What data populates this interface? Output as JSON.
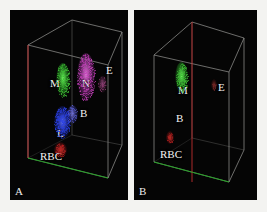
{
  "figure": {
    "background": "#f3f3f1",
    "panel_background": "#050505",
    "wire_color": "#9a9a96",
    "axis_colors": {
      "x": "#1faa1f",
      "y": "#c03030",
      "z": "#9a9a96"
    }
  },
  "panels": [
    {
      "id": "A",
      "label": "A",
      "labels": [
        {
          "text": "M",
          "x": 40,
          "y": 68,
          "color": "#f4f4f2"
        },
        {
          "text": "N",
          "x": 72,
          "y": 68,
          "color": "#f4f4f2"
        },
        {
          "text": "E",
          "x": 96,
          "y": 55,
          "color": "#f4f4f2"
        },
        {
          "text": "B",
          "x": 70,
          "y": 98,
          "color": "#f4f4f2"
        },
        {
          "text": "L",
          "x": 47,
          "y": 118,
          "color": "#f4f4f2"
        },
        {
          "text": "RBC",
          "x": 30,
          "y": 141,
          "color": "#f4f4f2"
        }
      ]
    },
    {
      "id": "B",
      "label": "B",
      "labels": [
        {
          "text": "M",
          "x": 44,
          "y": 75,
          "color": "#f4f4f2"
        },
        {
          "text": "E",
          "x": 84,
          "y": 72,
          "color": "#f4f4f2"
        },
        {
          "text": "B",
          "x": 42,
          "y": 103,
          "color": "#f4f4f2"
        },
        {
          "text": "RBC",
          "x": 26,
          "y": 139,
          "color": "#f4f4f2"
        }
      ]
    }
  ],
  "chart_data": {
    "type": "scatter",
    "title": "",
    "xlabel": "",
    "ylabel": "",
    "zlabel": "",
    "panels": [
      {
        "panel": "A",
        "clusters": [
          {
            "name": "M",
            "full_name": "Monocytes",
            "color": "#3fbe35",
            "cx": 53,
            "cy": 70,
            "rx": 7,
            "ry": 17,
            "density": 260
          },
          {
            "name": "N",
            "full_name": "Neutrophils",
            "color": "#c23fb8",
            "cx": 76,
            "cy": 67,
            "rx": 9,
            "ry": 24,
            "density": 420
          },
          {
            "name": "E",
            "full_name": "Eosinophils",
            "color": "#8a3a6e",
            "cx": 92,
            "cy": 74,
            "rx": 4,
            "ry": 8,
            "density": 50
          },
          {
            "name": "B",
            "full_name": "Basophils",
            "color": "#5a5fd0",
            "cx": 62,
            "cy": 104,
            "rx": 5,
            "ry": 9,
            "density": 70
          },
          {
            "name": "L",
            "full_name": "Lymphocytes",
            "color": "#2a3fe0",
            "cx": 52,
            "cy": 112,
            "rx": 8,
            "ry": 16,
            "density": 330
          },
          {
            "name": "RBC",
            "full_name": "Red blood cells",
            "color": "#b02020",
            "cx": 50,
            "cy": 140,
            "rx": 5,
            "ry": 7,
            "density": 110
          }
        ]
      },
      {
        "panel": "B",
        "clusters": [
          {
            "name": "M",
            "full_name": "Monocytes",
            "color": "#3fbe35",
            "cx": 48,
            "cy": 68,
            "rx": 6,
            "ry": 15,
            "density": 230
          },
          {
            "name": "E",
            "full_name": "Eosinophils",
            "color": "#7a2a2a",
            "cx": 80,
            "cy": 75,
            "rx": 2,
            "ry": 5,
            "density": 22
          },
          {
            "name": "RBC",
            "full_name": "Red blood cells",
            "color": "#b02020",
            "cx": 36,
            "cy": 128,
            "rx": 3,
            "ry": 5,
            "density": 45
          }
        ]
      }
    ],
    "legend": [
      {
        "key": "M",
        "label": "M"
      },
      {
        "key": "N",
        "label": "N"
      },
      {
        "key": "E",
        "label": "E"
      },
      {
        "key": "B",
        "label": "B"
      },
      {
        "key": "L",
        "label": "L"
      },
      {
        "key": "RBC",
        "label": "RBC"
      }
    ],
    "grid": false,
    "legend_position": "in-plot annotations"
  }
}
